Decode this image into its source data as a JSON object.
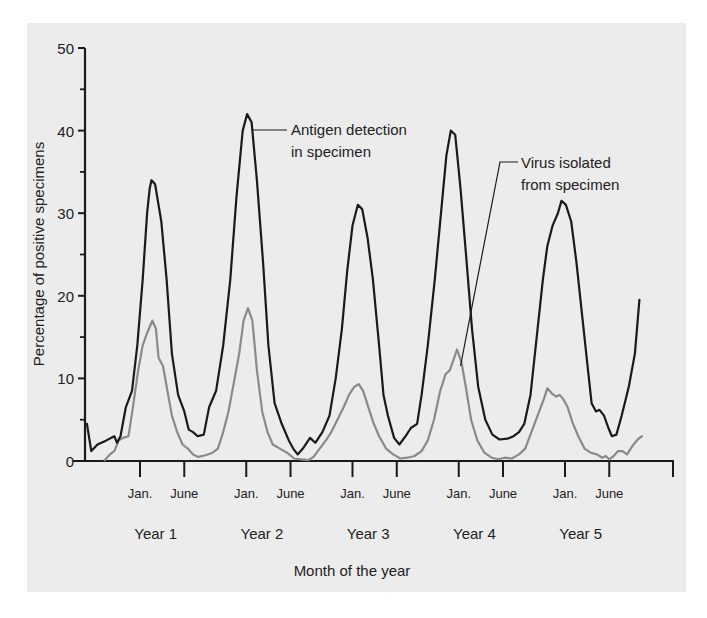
{
  "chart_data": {
    "type": "line",
    "title": "",
    "xlabel": "Month of the year",
    "ylabel": "Percentage of positive specimens",
    "ylim": [
      0,
      50
    ],
    "y_ticks_major": [
      0,
      10,
      20,
      30,
      40,
      50
    ],
    "y_ticks_minor": [
      5,
      15,
      25,
      35,
      45
    ],
    "grid": false,
    "x_unit": "months relative to January of Year 1",
    "xlim": [
      -6.2,
      60
    ],
    "x_tick_labels": [
      {
        "month": 0,
        "label": "Jan."
      },
      {
        "month": 5,
        "label": "June"
      },
      {
        "month": 12,
        "label": "Jan."
      },
      {
        "month": 17,
        "label": "June"
      },
      {
        "month": 24,
        "label": "Jan."
      },
      {
        "month": 29,
        "label": "June"
      },
      {
        "month": 36,
        "label": "Jan."
      },
      {
        "month": 41,
        "label": "June"
      },
      {
        "month": 48,
        "label": "Jan."
      },
      {
        "month": 53,
        "label": "June"
      }
    ],
    "year_labels": [
      {
        "month": 2,
        "label": "Year 1"
      },
      {
        "month": 14,
        "label": "Year 2"
      },
      {
        "month": 26,
        "label": "Year 3"
      },
      {
        "month": 38,
        "label": "Year 4"
      },
      {
        "month": 50,
        "label": "Year 5"
      }
    ],
    "series": [
      {
        "name": "Antigen detection in specimen",
        "color": "#1a1a1a",
        "points": [
          [
            -6.0,
            4.5
          ],
          [
            -5.5,
            1.2
          ],
          [
            -4.8,
            2.0
          ],
          [
            -3.8,
            2.5
          ],
          [
            -2.9,
            3.0
          ],
          [
            -2.6,
            2.2
          ],
          [
            -2.2,
            3.0
          ],
          [
            -1.6,
            6.5
          ],
          [
            -0.9,
            8.5
          ],
          [
            -0.3,
            14
          ],
          [
            0.3,
            22
          ],
          [
            0.8,
            30
          ],
          [
            1.1,
            33
          ],
          [
            1.3,
            34
          ],
          [
            1.7,
            33.5
          ],
          [
            2.4,
            29
          ],
          [
            3.0,
            22
          ],
          [
            3.6,
            13
          ],
          [
            4.3,
            8
          ],
          [
            5.0,
            6
          ],
          [
            5.5,
            3.8
          ],
          [
            6.0,
            3.5
          ],
          [
            6.5,
            3.0
          ],
          [
            7.2,
            3.2
          ],
          [
            7.8,
            6.5
          ],
          [
            8.6,
            8.5
          ],
          [
            9.4,
            14
          ],
          [
            10.2,
            22
          ],
          [
            10.9,
            32
          ],
          [
            11.6,
            40
          ],
          [
            12.1,
            42
          ],
          [
            12.6,
            41
          ],
          [
            13.2,
            34
          ],
          [
            13.9,
            24
          ],
          [
            14.5,
            14
          ],
          [
            15.2,
            7
          ],
          [
            16.0,
            4.5
          ],
          [
            16.8,
            2.5
          ],
          [
            17.3,
            1.5
          ],
          [
            17.8,
            0.8
          ],
          [
            18.4,
            1.5
          ],
          [
            19.2,
            2.8
          ],
          [
            19.8,
            2.2
          ],
          [
            20.6,
            3.5
          ],
          [
            21.4,
            5.5
          ],
          [
            22.1,
            10
          ],
          [
            22.8,
            16
          ],
          [
            23.4,
            23
          ],
          [
            24.0,
            28.5
          ],
          [
            24.6,
            31
          ],
          [
            25.1,
            30.5
          ],
          [
            25.7,
            27
          ],
          [
            26.3,
            22
          ],
          [
            27.0,
            14
          ],
          [
            27.5,
            8
          ],
          [
            28.0,
            5.5
          ],
          [
            28.7,
            2.8
          ],
          [
            29.3,
            2.0
          ],
          [
            30.0,
            3.0
          ],
          [
            30.6,
            4.0
          ],
          [
            31.3,
            4.5
          ],
          [
            31.8,
            8.0
          ],
          [
            32.5,
            14
          ],
          [
            33.3,
            22
          ],
          [
            34.0,
            30
          ],
          [
            34.6,
            37
          ],
          [
            35.1,
            40
          ],
          [
            35.6,
            39.5
          ],
          [
            36.2,
            33
          ],
          [
            36.9,
            24
          ],
          [
            37.5,
            16
          ],
          [
            38.2,
            9
          ],
          [
            39.0,
            5
          ],
          [
            39.8,
            3.2
          ],
          [
            40.6,
            2.6
          ],
          [
            41.5,
            2.7
          ],
          [
            42.2,
            3.0
          ],
          [
            42.8,
            3.5
          ],
          [
            43.4,
            4.5
          ],
          [
            44.1,
            8
          ],
          [
            44.8,
            15
          ],
          [
            45.5,
            22
          ],
          [
            46.0,
            26
          ],
          [
            46.6,
            28.5
          ],
          [
            47.2,
            30
          ],
          [
            47.6,
            31.5
          ],
          [
            48.1,
            31
          ],
          [
            48.7,
            29
          ],
          [
            49.3,
            24
          ],
          [
            50.0,
            17
          ],
          [
            50.6,
            11
          ],
          [
            51.0,
            7
          ],
          [
            51.5,
            6.0
          ],
          [
            51.9,
            6.2
          ],
          [
            52.4,
            5.5
          ],
          [
            52.9,
            4.0
          ],
          [
            53.3,
            3.0
          ],
          [
            53.8,
            3.2
          ],
          [
            54.4,
            5.5
          ],
          [
            55.2,
            9
          ],
          [
            55.9,
            13
          ],
          [
            56.4,
            19.5
          ]
        ]
      },
      {
        "name": "Virus isolated from specimen",
        "color": "#8a8a8a",
        "points": [
          [
            -4.0,
            0.1
          ],
          [
            -3.4,
            0.8
          ],
          [
            -2.9,
            1.2
          ],
          [
            -2.4,
            2.5
          ],
          [
            -1.9,
            2.8
          ],
          [
            -1.3,
            3.0
          ],
          [
            -0.8,
            6.5
          ],
          [
            -0.2,
            11
          ],
          [
            0.3,
            14
          ],
          [
            0.8,
            15.5
          ],
          [
            1.2,
            16.5
          ],
          [
            1.4,
            17
          ],
          [
            1.8,
            16
          ],
          [
            2.1,
            12.5
          ],
          [
            2.6,
            11.5
          ],
          [
            3.1,
            8.5
          ],
          [
            3.6,
            5.5
          ],
          [
            4.2,
            3.5
          ],
          [
            4.8,
            2.0
          ],
          [
            5.4,
            1.5
          ],
          [
            6.0,
            0.8
          ],
          [
            6.6,
            0.5
          ],
          [
            7.4,
            0.7
          ],
          [
            8.2,
            1.0
          ],
          [
            8.8,
            1.5
          ],
          [
            9.4,
            3.5
          ],
          [
            10.0,
            6.0
          ],
          [
            10.6,
            9.5
          ],
          [
            11.2,
            13
          ],
          [
            11.7,
            17
          ],
          [
            12.2,
            18.5
          ],
          [
            12.7,
            17
          ],
          [
            13.2,
            11
          ],
          [
            13.8,
            6
          ],
          [
            14.4,
            3.5
          ],
          [
            15.0,
            2.0
          ],
          [
            15.8,
            1.5
          ],
          [
            16.6,
            1.0
          ],
          [
            17.4,
            0.3
          ],
          [
            18.2,
            0.2
          ],
          [
            19.0,
            0.1
          ],
          [
            19.6,
            0.5
          ],
          [
            20.3,
            1.5
          ],
          [
            21.0,
            2.5
          ],
          [
            21.6,
            3.5
          ],
          [
            22.3,
            5.0
          ],
          [
            23.0,
            6.5
          ],
          [
            23.6,
            8.0
          ],
          [
            24.2,
            9.0
          ],
          [
            24.7,
            9.3
          ],
          [
            25.2,
            8.5
          ],
          [
            25.8,
            6.5
          ],
          [
            26.4,
            4.5
          ],
          [
            27.0,
            3.0
          ],
          [
            27.8,
            1.5
          ],
          [
            28.6,
            0.8
          ],
          [
            29.4,
            0.3
          ],
          [
            30.2,
            0.4
          ],
          [
            31.0,
            0.6
          ],
          [
            31.8,
            1.2
          ],
          [
            32.5,
            2.5
          ],
          [
            33.2,
            5
          ],
          [
            33.9,
            8.5
          ],
          [
            34.5,
            10.5
          ],
          [
            35.0,
            11
          ],
          [
            35.4,
            12.2
          ],
          [
            35.8,
            13.5
          ],
          [
            36.3,
            12
          ],
          [
            36.8,
            9
          ],
          [
            37.4,
            5
          ],
          [
            38.1,
            2.5
          ],
          [
            38.9,
            1.0
          ],
          [
            39.7,
            0.4
          ],
          [
            40.5,
            0.2
          ],
          [
            41.2,
            0.4
          ],
          [
            42.0,
            0.3
          ],
          [
            42.8,
            0.8
          ],
          [
            43.5,
            1.5
          ],
          [
            44.2,
            3.5
          ],
          [
            44.9,
            5.5
          ],
          [
            45.6,
            7.5
          ],
          [
            46.0,
            8.8
          ],
          [
            46.5,
            8.2
          ],
          [
            47.0,
            7.8
          ],
          [
            47.4,
            8.0
          ],
          [
            47.8,
            7.5
          ],
          [
            48.3,
            6.5
          ],
          [
            48.9,
            4.5
          ],
          [
            49.5,
            3.0
          ],
          [
            50.2,
            1.5
          ],
          [
            50.9,
            1.0
          ],
          [
            51.6,
            0.8
          ],
          [
            52.2,
            0.4
          ],
          [
            52.6,
            0.6
          ],
          [
            53.0,
            0.2
          ],
          [
            53.5,
            0.6
          ],
          [
            54.0,
            1.2
          ],
          [
            54.5,
            1.2
          ],
          [
            55.0,
            0.8
          ],
          [
            55.6,
            1.8
          ],
          [
            56.2,
            2.6
          ],
          [
            56.7,
            3.0
          ]
        ]
      }
    ],
    "annotations": [
      {
        "text_lines": [
          "Antigen detection",
          "in specimen"
        ],
        "series": "Antigen detection in specimen",
        "anchor_month": 12.4,
        "anchor_value": 40.5
      },
      {
        "text_lines": [
          "Virus isolated",
          "from specimen"
        ],
        "series": "Virus isolated from specimen",
        "anchor_month": 36.2,
        "anchor_value": 11.5
      }
    ]
  }
}
